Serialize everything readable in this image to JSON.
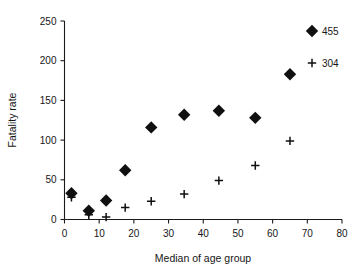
{
  "chart_data": {
    "type": "scatter",
    "title": "",
    "xlabel": "Median of age group",
    "ylabel": "Fatality rate",
    "xlim": [
      0,
      80
    ],
    "ylim": [
      0,
      250
    ],
    "xticks": [
      0,
      10,
      20,
      30,
      40,
      50,
      60,
      70,
      80
    ],
    "yticks": [
      0,
      50,
      100,
      150,
      200,
      250
    ],
    "xtick_labels": [
      "0",
      "10",
      "20",
      "30",
      "40",
      "50",
      "60",
      "70",
      "80"
    ],
    "ytick_labels": [
      "0",
      "50",
      "100",
      "150",
      "200",
      "250"
    ],
    "grid": false,
    "legend_position": "top-right",
    "series": [
      {
        "name": "455",
        "marker": "diamond",
        "color": "#101010",
        "x": [
          2,
          7,
          12,
          17.5,
          25,
          34.5,
          44.5,
          55,
          65
        ],
        "y": [
          33,
          11,
          24,
          62,
          116,
          132,
          137,
          128,
          183
        ]
      },
      {
        "name": "304",
        "marker": "plus",
        "color": "#101010",
        "x": [
          2,
          7,
          12,
          17.5,
          25,
          34.5,
          44.5,
          55,
          65
        ],
        "y": [
          28,
          6,
          3,
          15,
          23,
          32,
          49,
          68,
          99
        ]
      }
    ]
  },
  "legend": {
    "entries": [
      {
        "label": "455",
        "marker": "diamond"
      },
      {
        "label": "304",
        "marker": "plus"
      }
    ]
  },
  "axes": {
    "x_title": "Median of age group",
    "y_title": "Fatality rate"
  }
}
